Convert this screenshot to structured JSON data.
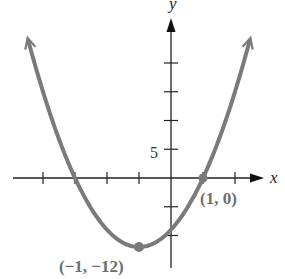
{
  "chart_data": {
    "type": "line",
    "title": "",
    "function": "f(x) = 3(x + 1)^2 - 12",
    "xlabel": "x",
    "ylabel": "y",
    "x_ticks": [
      -4,
      -3,
      -2,
      -1,
      0,
      1,
      2
    ],
    "y_ticks": [
      -10,
      -5,
      5,
      10,
      15,
      20
    ],
    "y_tick_labels": [
      {
        "value": 5,
        "label": "5"
      }
    ],
    "xlim": [
      -5,
      3
    ],
    "ylim": [
      -15,
      30
    ],
    "grid": false,
    "series": [
      {
        "name": "parabola",
        "color": "#7a7a7a",
        "x": [
          -4.5,
          -4,
          -3,
          -2,
          -1,
          0,
          1,
          2,
          2.45
        ],
        "y": [
          24.75,
          15,
          0,
          -9,
          -12,
          -9,
          0,
          15,
          23.7
        ]
      }
    ],
    "points": [
      {
        "x": -1,
        "y": -12,
        "label": "(−1, −12)"
      },
      {
        "x": 1,
        "y": 0,
        "label": "(1, 0)"
      }
    ]
  },
  "labels": {
    "x_axis": "x",
    "y_axis": "y",
    "tick5": "5",
    "vertex": "(−1, −12)",
    "root": "(1, 0)"
  }
}
